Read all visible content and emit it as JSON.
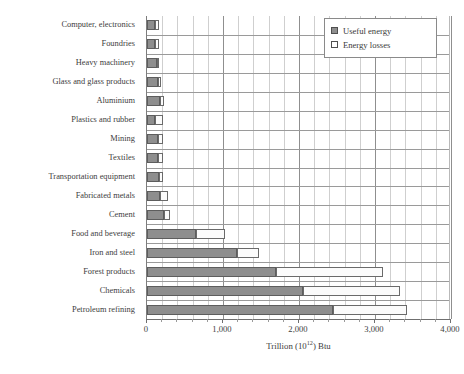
{
  "chart_data": {
    "type": "bar",
    "orientation": "horizontal",
    "stacked": true,
    "title": "",
    "xlabel": "Trillion (10¹²) Btu",
    "ylabel": "",
    "xlim": [
      0,
      4000
    ],
    "xticks": [
      0,
      1000,
      2000,
      3000,
      4000
    ],
    "xtick_labels": [
      "0",
      "1,000",
      "2,000",
      "3,000",
      "4,000"
    ],
    "minor_tick_interval": 200,
    "grid": true,
    "legend_position": "top-right",
    "categories": [
      "Computer, electronics",
      "Foundries",
      "Heavy machinery",
      "Glass and glass products",
      "Aluminium",
      "Plastics and rubber",
      "Mining",
      "Textiles",
      "Transportation equipment",
      "Fabricated metals",
      "Cement",
      "Food and beverage",
      "Iron and steel",
      "Forest products",
      "Chemicals",
      "Petroleum refining"
    ],
    "series": [
      {
        "name": "Useful energy",
        "color": "#8e8e8e",
        "values": [
          100,
          105,
          130,
          150,
          165,
          110,
          140,
          150,
          160,
          175,
          230,
          640,
          1180,
          1700,
          2050,
          2450
        ]
      },
      {
        "name": "Energy losses",
        "color": "#fbfbfb",
        "values": [
          55,
          50,
          30,
          40,
          60,
          100,
          75,
          60,
          55,
          105,
          70,
          390,
          290,
          1400,
          1280,
          970
        ]
      }
    ],
    "totals": [
      155,
      155,
      160,
      190,
      225,
      210,
      215,
      210,
      215,
      280,
      300,
      1030,
      1470,
      3100,
      3330,
      3420
    ]
  },
  "legend": {
    "items": [
      {
        "label": "Useful energy",
        "swatch": "filled-square-icon"
      },
      {
        "label": "Energy losses",
        "swatch": "hollow-square-icon"
      }
    ]
  },
  "axis": {
    "x_title_prefix": "Trillion (10",
    "x_title_exponent": "12",
    "x_title_suffix": ") Btu"
  },
  "colors": {
    "useful_energy_fill": "#8e8e8e",
    "useful_energy_border": "#5d5d5d",
    "energy_losses_fill": "#fbfbfb",
    "energy_losses_border": "#6a6a6a",
    "grid_major": "#8f8f8f",
    "grid_minor": "#cfcfcf",
    "axis": "#6f6f6f",
    "text": "#3a3a3a"
  }
}
